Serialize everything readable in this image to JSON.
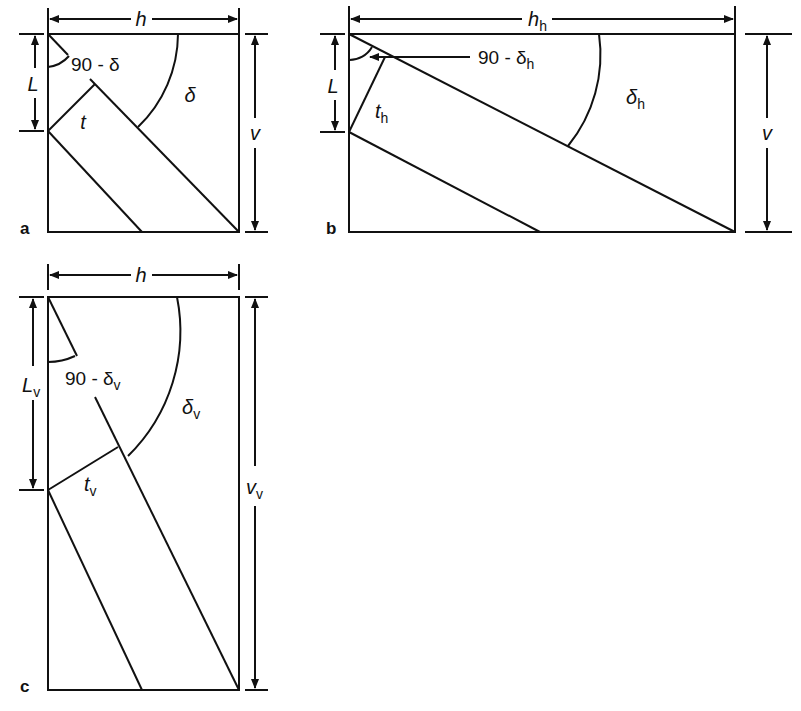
{
  "figure": {
    "panels": [
      {
        "id": "a",
        "panel_label": "a",
        "width_label": "h",
        "height_label": "v",
        "length_label": "L",
        "thickness_label": "t",
        "angle_label": "δ",
        "complement_angle_label": "90 - δ"
      },
      {
        "id": "b",
        "panel_label": "b",
        "width_label": "h",
        "width_sub": "h",
        "height_label": "v",
        "length_label": "L",
        "thickness_label": "t",
        "thickness_sub": "h",
        "angle_label": "δ",
        "angle_sub": "h",
        "complement_angle_label": "90 - δ",
        "complement_angle_sub": "h"
      },
      {
        "id": "c",
        "panel_label": "c",
        "width_label": "h",
        "height_label": "v",
        "height_sub": "v",
        "length_label": "L",
        "length_sub": "v",
        "thickness_label": "t",
        "thickness_sub": "v",
        "angle_label": "δ",
        "angle_sub": "v",
        "complement_angle_label": "90 - δ",
        "complement_angle_sub": "v"
      }
    ]
  }
}
